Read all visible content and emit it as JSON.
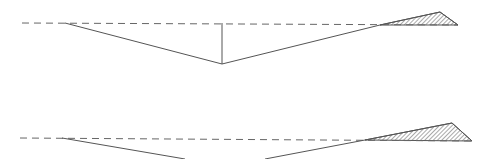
{
  "diagram": {
    "colors": {
      "line": "#555555",
      "dash": "#666666",
      "hatch": "#555555",
      "background": "#ffffff"
    },
    "top": {
      "baseline": {
        "x1": 22,
        "y1": 23,
        "x2": 458,
        "y2": 25
      },
      "profile_points": [
        [
          65,
          23
        ],
        [
          222,
          64
        ],
        [
          380,
          25
        ],
        [
          440,
          12
        ],
        [
          458,
          25
        ]
      ],
      "vertical": {
        "x": 222,
        "y1": 23,
        "y2": 64
      },
      "hatched_region": [
        [
          380,
          25
        ],
        [
          440,
          12
        ],
        [
          458,
          25
        ]
      ]
    },
    "bottom": {
      "baseline": {
        "x1": 20,
        "y1": 138,
        "x2": 472,
        "y2": 141
      },
      "profile_left": [
        [
          62,
          138
        ],
        [
          185,
          159
        ]
      ],
      "profile_right": [
        [
          265,
          159
        ],
        [
          365,
          140
        ],
        [
          452,
          123
        ],
        [
          472,
          141
        ]
      ],
      "hatched_region": [
        [
          365,
          140
        ],
        [
          452,
          123
        ],
        [
          472,
          141
        ]
      ]
    }
  }
}
